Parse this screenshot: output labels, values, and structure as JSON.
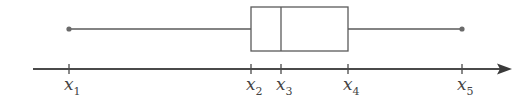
{
  "diagram": {
    "type": "box-plot",
    "colors": {
      "stroke": "#5a5a5a",
      "dot": "#6a6a6a",
      "text": "#444444",
      "background": "#ffffff"
    },
    "axis": {
      "y": 69,
      "x_start": 33,
      "x_end": 512
    },
    "box": {
      "top": 7,
      "bottom": 51,
      "whisker_y": 29
    },
    "points": [
      {
        "id": "x1",
        "base": "x",
        "sub": "1",
        "x": 69,
        "role": "minimum"
      },
      {
        "id": "x2",
        "base": "x",
        "sub": "2",
        "x": 251,
        "role": "lower-quartile"
      },
      {
        "id": "x3",
        "base": "x",
        "sub": "3",
        "x": 281,
        "role": "median"
      },
      {
        "id": "x4",
        "base": "x",
        "sub": "4",
        "x": 348,
        "role": "upper-quartile"
      },
      {
        "id": "x5",
        "base": "x",
        "sub": "5",
        "x": 462,
        "role": "maximum"
      }
    ]
  }
}
